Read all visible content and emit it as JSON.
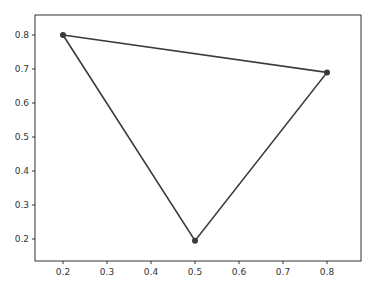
{
  "chart_data": {
    "type": "line",
    "title": "",
    "xlabel": "",
    "ylabel": "",
    "xlim": [
      0.13,
      0.87
    ],
    "ylim": [
      0.13,
      0.83
    ],
    "grid": false,
    "xticks": [
      0.2,
      0.3,
      0.4,
      0.5,
      0.6,
      0.7,
      0.8
    ],
    "xtick_labels": [
      "0.2",
      "0.3",
      "0.4",
      "0.5",
      "0.6",
      "0.7",
      "0.8"
    ],
    "yticks": [
      0.2,
      0.3,
      0.4,
      0.5,
      0.6,
      0.7,
      0.8
    ],
    "ytick_labels": [
      "0.2",
      "0.3",
      "0.4",
      "0.5",
      "0.6",
      "0.7",
      "0.8"
    ],
    "series": [
      {
        "name": "triangle",
        "closed": true,
        "marker": "circle",
        "color": "#3a3a3a",
        "points": [
          {
            "x": 0.2,
            "y": 0.8
          },
          {
            "x": 0.8,
            "y": 0.69
          },
          {
            "x": 0.5,
            "y": 0.195
          }
        ]
      }
    ]
  }
}
